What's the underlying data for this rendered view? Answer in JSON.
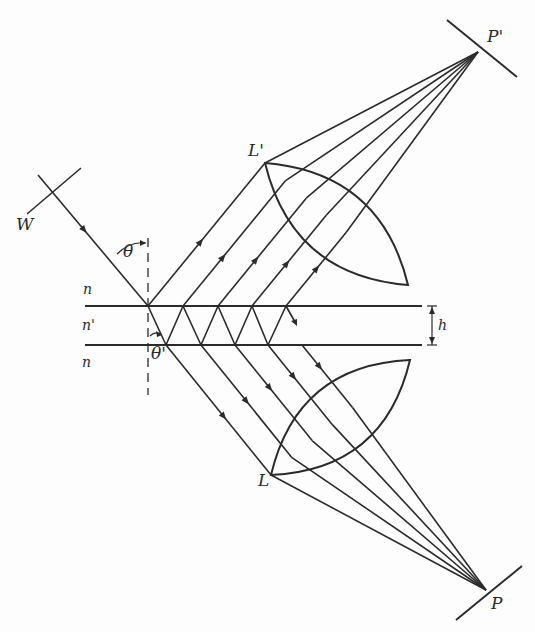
{
  "figure": {
    "type": "optics-diagram"
  },
  "labels": {
    "wavefront": "W",
    "incident_angle": "θ",
    "refracted_angle": "θ'",
    "medium_top": "n",
    "medium_plate": "n'",
    "medium_bottom": "n",
    "thickness": "h",
    "lens_reflected": "L'",
    "lens_transmitted": "L",
    "focus_reflected": "P'",
    "focus_transmitted": "P"
  },
  "colors": {
    "line": "#2b2b2b",
    "background": "#fdfdfd"
  },
  "geometry": {
    "slab": {
      "x_start": 85,
      "x_end": 422,
      "y_top": 306,
      "y_bottom": 345
    },
    "normal_x": 148,
    "normal_y_range": [
      238,
      395
    ],
    "incident_start": [
      38,
      175
    ],
    "wavefront_W": [
      [
        27,
        214
      ],
      [
        81,
        168
      ]
    ],
    "top_points_x": [
      148,
      183,
      218,
      252,
      286
    ],
    "bottom_points_x": [
      166,
      201,
      235,
      268,
      302
    ],
    "lens_Lprime": {
      "tip1": [
        265,
        163
      ],
      "tip2": [
        408,
        285
      ],
      "bulge": 34
    },
    "lens_L": {
      "tip1": [
        271,
        475
      ],
      "tip2": [
        410,
        360
      ],
      "bulge": 34
    },
    "focus_Pprime": [
      478,
      52
    ],
    "focus_P": [
      486,
      590
    ],
    "detector_Pprime": [
      [
        447,
        20
      ],
      [
        517,
        77
      ]
    ],
    "detector_P": [
      [
        456,
        620
      ],
      [
        522,
        566
      ]
    ],
    "h_marker_x": 432
  }
}
